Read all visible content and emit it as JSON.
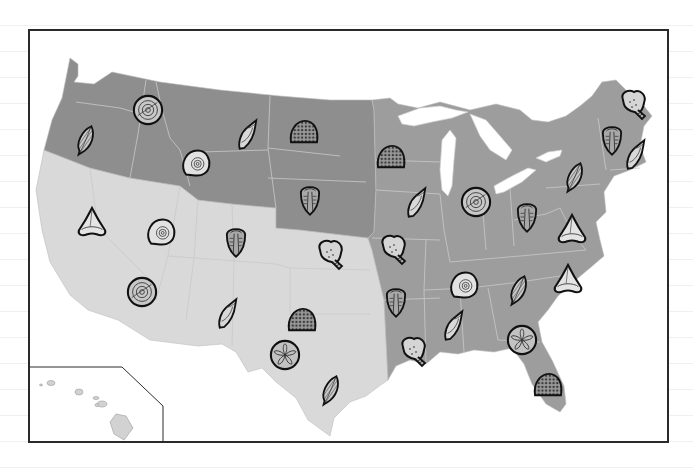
{
  "map": {
    "title": "Fossil Map of the United States",
    "colors": {
      "northwest_plains": "#8e8e8e",
      "east": "#9d9d9d",
      "southwest": "#d9d9d9",
      "borders": "#c8c8c8",
      "lakes": "#ffffff",
      "frame": "#2a2a2a",
      "icon_stroke": "#111111"
    },
    "regions": [
      {
        "id": "northwest-plains",
        "label": "Northwest and Northern Plains"
      },
      {
        "id": "east",
        "label": "Midwest and East"
      },
      {
        "id": "southwest",
        "label": "Southwest and West"
      }
    ],
    "inset": {
      "label": "Hawaii"
    }
  },
  "fossils": [
    {
      "type": "leaf",
      "x": 85,
      "y": 140,
      "state": "Oregon"
    },
    {
      "type": "ammonite-spiral",
      "x": 148,
      "y": 110,
      "state": "Washington/Idaho"
    },
    {
      "type": "ammonite",
      "x": 195,
      "y": 163,
      "state": "Montana/Wyoming"
    },
    {
      "type": "gastropod",
      "x": 248,
      "y": 135,
      "state": "Montana"
    },
    {
      "type": "coral",
      "x": 304,
      "y": 132,
      "state": "North Dakota"
    },
    {
      "type": "trilobite",
      "x": 310,
      "y": 200,
      "state": "Nebraska"
    },
    {
      "type": "shark-tooth",
      "x": 92,
      "y": 223,
      "state": "California"
    },
    {
      "type": "ammonite",
      "x": 160,
      "y": 232,
      "state": "Nevada"
    },
    {
      "type": "trilobite",
      "x": 236,
      "y": 242,
      "state": "Utah/Colorado"
    },
    {
      "type": "crinoid",
      "x": 330,
      "y": 255,
      "state": "Kansas"
    },
    {
      "type": "ammonite-spiral",
      "x": 142,
      "y": 292,
      "state": "Southern California"
    },
    {
      "type": "gastropod",
      "x": 228,
      "y": 314,
      "state": "Arizona"
    },
    {
      "type": "coral",
      "x": 302,
      "y": 320,
      "state": "Oklahoma"
    },
    {
      "type": "sand-dollar",
      "x": 285,
      "y": 355,
      "state": "Texas"
    },
    {
      "type": "leaf",
      "x": 330,
      "y": 390,
      "state": "South Texas"
    },
    {
      "type": "coral",
      "x": 391,
      "y": 157,
      "state": "Minnesota"
    },
    {
      "type": "gastropod",
      "x": 417,
      "y": 203,
      "state": "Iowa"
    },
    {
      "type": "ammonite-spiral",
      "x": 476,
      "y": 202,
      "state": "Michigan/Indiana"
    },
    {
      "type": "trilobite",
      "x": 527,
      "y": 217,
      "state": "Ohio"
    },
    {
      "type": "leaf",
      "x": 574,
      "y": 177,
      "state": "New York"
    },
    {
      "type": "trilobite",
      "x": 612,
      "y": 140,
      "state": "Vermont"
    },
    {
      "type": "crinoid",
      "x": 633,
      "y": 105,
      "state": "Maine"
    },
    {
      "type": "gastropod",
      "x": 636,
      "y": 155,
      "state": "Massachusetts"
    },
    {
      "type": "shark-tooth",
      "x": 572,
      "y": 230,
      "state": "Virginia"
    },
    {
      "type": "crinoid",
      "x": 393,
      "y": 250,
      "state": "Missouri"
    },
    {
      "type": "trilobite",
      "x": 396,
      "y": 302,
      "state": "Arkansas"
    },
    {
      "type": "ammonite",
      "x": 463,
      "y": 285,
      "state": "Tennessee"
    },
    {
      "type": "leaf",
      "x": 518,
      "y": 290,
      "state": "North Carolina"
    },
    {
      "type": "shark-tooth",
      "x": 568,
      "y": 280,
      "state": "South Carolina"
    },
    {
      "type": "gastropod",
      "x": 454,
      "y": 326,
      "state": "Mississippi"
    },
    {
      "type": "crinoid",
      "x": 413,
      "y": 352,
      "state": "Louisiana"
    },
    {
      "type": "sand-dollar",
      "x": 522,
      "y": 340,
      "state": "Georgia"
    },
    {
      "type": "coral",
      "x": 548,
      "y": 385,
      "state": "Florida"
    }
  ]
}
